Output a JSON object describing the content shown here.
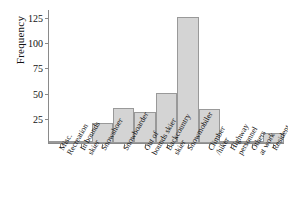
{
  "chart_data": {
    "type": "bar",
    "title": "",
    "xlabel": "",
    "ylabel": "Frequency",
    "ylim": [
      0,
      132
    ],
    "yticks": [
      25,
      50,
      75,
      100,
      125
    ],
    "ytick_labels": [
      "25",
      "50",
      "75",
      "100",
      "125"
    ],
    "grid": false,
    "legend": "none",
    "bar_color": "#d4d4d4",
    "bar_edge_color": "#999999",
    "axis_color": "#8a8a8a",
    "categories": [
      "Misc. Recreation",
      "In bounds skier",
      "Snowshoer",
      "Snowboarder",
      "Out of bounds skier",
      "Backcountry skier",
      "Snowmobiler",
      "Climber /hiker",
      "Highway personnel",
      "Others at work",
      "Resident"
    ],
    "category_lines": [
      [
        "Misc.",
        "Recreation"
      ],
      [
        "In bounds",
        "skier"
      ],
      [
        "Snowshoer"
      ],
      [
        "Snowboarder"
      ],
      [
        "Out of",
        "bounds skier"
      ],
      [
        "Backcountry",
        "skier"
      ],
      [
        "Snowmobiler"
      ],
      [
        "Climber",
        "/hiker"
      ],
      [
        "Highway",
        "personnel"
      ],
      [
        "Others",
        "at work"
      ],
      [
        "Resident"
      ]
    ],
    "values": [
      2,
      2,
      20,
      35,
      31,
      50,
      125,
      34,
      1,
      1,
      10
    ]
  }
}
